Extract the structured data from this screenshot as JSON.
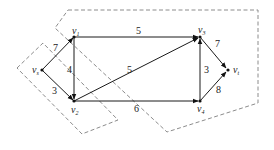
{
  "diagram": {
    "type": "flow-network",
    "nodes": [
      {
        "id": "vs",
        "label": "v",
        "sub": "s",
        "x": 42,
        "y": 70
      },
      {
        "id": "v1",
        "label": "v",
        "sub": "1",
        "x": 74,
        "y": 37
      },
      {
        "id": "v2",
        "label": "v",
        "sub": "2",
        "x": 74,
        "y": 101
      },
      {
        "id": "v3",
        "label": "v",
        "sub": "3",
        "x": 200,
        "y": 37
      },
      {
        "id": "v4",
        "label": "v",
        "sub": "4",
        "x": 200,
        "y": 101
      },
      {
        "id": "vt",
        "label": "v",
        "sub": "t",
        "x": 228,
        "y": 70
      }
    ],
    "edges": [
      {
        "from": "vs",
        "to": "v1",
        "weight": "7"
      },
      {
        "from": "vs",
        "to": "v2",
        "weight": "3"
      },
      {
        "from": "v1",
        "to": "v3",
        "weight": "5"
      },
      {
        "from": "v1",
        "to": "v2",
        "weight": "4"
      },
      {
        "from": "v2",
        "to": "v3",
        "weight": "5"
      },
      {
        "from": "v2",
        "to": "v4",
        "weight": "6"
      },
      {
        "from": "v4",
        "to": "v3",
        "weight": "3"
      },
      {
        "from": "v3",
        "to": "vt",
        "weight": "7"
      },
      {
        "from": "v4",
        "to": "vt",
        "weight": "8"
      }
    ],
    "cuts": [
      {
        "name": "small-cut",
        "style": "dashed"
      },
      {
        "name": "large-cut",
        "style": "dashed"
      }
    ]
  }
}
